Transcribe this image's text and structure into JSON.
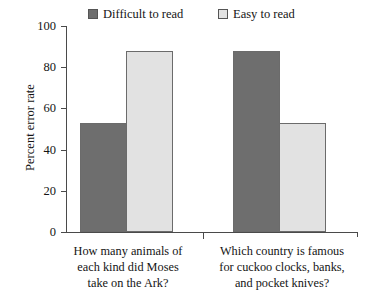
{
  "chart_data": {
    "type": "bar",
    "title": "",
    "subtitle": "",
    "xlabel": "",
    "ylabel": "Percent error rate",
    "ylim": [
      0,
      100
    ],
    "ytick_values": [
      0,
      20,
      40,
      60,
      80,
      100
    ],
    "ytick_labels": [
      "0",
      "20",
      "40",
      "60",
      "80",
      "100"
    ],
    "grid": false,
    "legend_position": "top",
    "categories": [
      "How many animals of each kind did Moses take on the Ark?",
      "Which country is famous for cuckoo clocks, banks, and pocket knives?"
    ],
    "category_lines": [
      [
        "How many animals of",
        "each kind did Moses",
        "take on the Ark?"
      ],
      [
        "Which country is famous",
        "for cuckoo clocks, banks,",
        "and pocket knives?"
      ]
    ],
    "series": [
      {
        "name": "Difficult to read",
        "values": [
          53,
          88
        ],
        "color": "#6e6e6e"
      },
      {
        "name": "Easy to read",
        "values": [
          88,
          53
        ],
        "color": "#e2e2e2"
      }
    ]
  },
  "legend": {
    "entries": [
      {
        "label": "Difficult to read",
        "color": "#6e6e6e"
      },
      {
        "label": "Easy to read",
        "color": "#e2e2e2"
      }
    ]
  },
  "axis": {
    "y_title": "Percent error rate",
    "y_labels": [
      "100",
      "80",
      "60",
      "40",
      "20",
      "0"
    ]
  },
  "colors": {
    "difficult_fill": "#6e6e6e",
    "easy_fill": "#e2e2e2",
    "bar_stroke": "#6b6b6b",
    "axis": "#4a4a4a",
    "text": "#141414",
    "background": "#ffffff"
  }
}
